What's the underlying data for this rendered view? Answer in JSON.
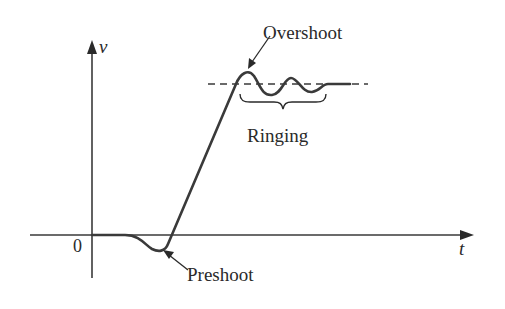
{
  "diagram": {
    "title": "",
    "axes": {
      "y_label": "v",
      "x_label": "t",
      "origin_label": "0"
    },
    "annotations": {
      "overshoot": "Overshoot",
      "ringing": "Ringing",
      "preshoot": "Preshoot"
    },
    "colors": {
      "stroke": "#3a3a3a",
      "text": "#2a2a2a",
      "background": "#ffffff"
    }
  }
}
